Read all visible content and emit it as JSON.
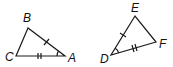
{
  "triangles": [
    {
      "name": "ABC",
      "vertices": {
        "A": {
          "label": "A",
          "x": 65,
          "y": 56
        },
        "B": {
          "label": "B",
          "x": 28,
          "y": 28
        },
        "C": {
          "label": "C",
          "x": 16,
          "y": 56
        }
      },
      "markings": {
        "single_tick_side": "BA",
        "double_tick_side": "CA",
        "angle_arc_at": "A"
      }
    },
    {
      "name": "DEF",
      "vertices": {
        "D": {
          "label": "D",
          "x": 111,
          "y": 55
        },
        "E": {
          "label": "E",
          "x": 135,
          "y": 16
        },
        "F": {
          "label": "F",
          "x": 156,
          "y": 42
        }
      },
      "markings": {
        "single_tick_side": "DE",
        "double_tick_side": "DF",
        "angle_arc_at": "D"
      }
    }
  ],
  "colors": {
    "stroke": "#1a1a1a",
    "background": "#ffffff"
  }
}
